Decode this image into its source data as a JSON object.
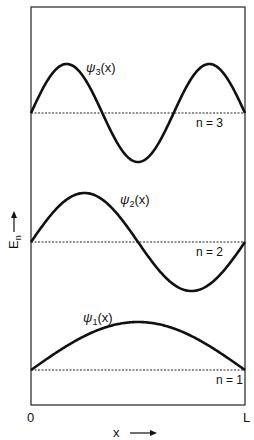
{
  "figure": {
    "x_label": "x",
    "y_label": "E",
    "y_label_sub": "n",
    "x_start": "0",
    "x_end": "L"
  },
  "states": [
    {
      "n": 1,
      "psi_symbol": "ψ",
      "psi_sub": "1",
      "psi_arg": "(x)",
      "level_label": "n = 1"
    },
    {
      "n": 2,
      "psi_symbol": "ψ",
      "psi_sub": "2",
      "psi_arg": "(x)",
      "level_label": "n = 2"
    },
    {
      "n": 3,
      "psi_symbol": "ψ",
      "psi_sub": "3",
      "psi_arg": "(x)",
      "level_label": "n = 3"
    }
  ],
  "colors": {
    "line": "#111111",
    "background": "#ffffff"
  }
}
